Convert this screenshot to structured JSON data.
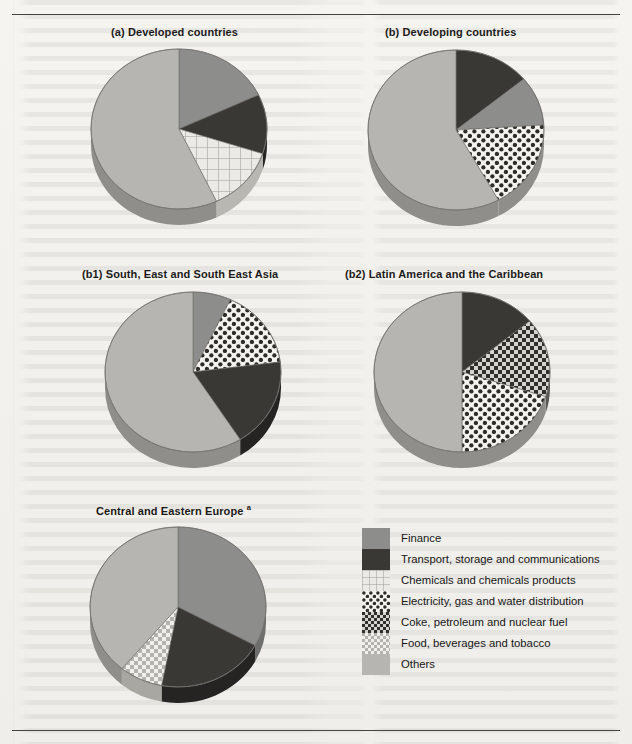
{
  "page": {
    "background_color": "#f3f2ef",
    "rule_color": "#45433f"
  },
  "chart_data": {
    "type": "pie",
    "title": "",
    "legend_position": "bottom-right",
    "categories": [
      "Finance",
      "Transport, storage and communications",
      "Chemicals and chemicals products",
      "Electricity, gas and water distribution",
      "Coke, petroleum and nuclear fuel",
      "Food, beverages and tobacco",
      "Others"
    ],
    "category_colors": [
      "#8d8d8b",
      "#393835",
      "#e7e6e2",
      "#f0efeb",
      "#6f6e6a",
      "#d9d8d3",
      "#b6b5b1"
    ],
    "panels": [
      {
        "id": "a",
        "title": "(a) Developed countries",
        "title_prefix": "(a)",
        "title_text": "Developed countries",
        "slices": [
          {
            "category": "Finance",
            "value": 18
          },
          {
            "category": "Transport, storage and communications",
            "value": 12
          },
          {
            "category": "Chemicals and chemicals products",
            "value": 13
          },
          {
            "category": "Others",
            "value": 57
          }
        ]
      },
      {
        "id": "b",
        "title": "(b) Developing countries",
        "title_prefix": "(b)",
        "title_text": "Developing countries",
        "slices": [
          {
            "category": "Transport, storage and communications",
            "value": 14
          },
          {
            "category": "Finance",
            "value": 10
          },
          {
            "category": "Electricity, gas and water distribution",
            "value": 18
          },
          {
            "category": "Others",
            "value": 58
          }
        ]
      },
      {
        "id": "b1",
        "title": "(b1) South, East and South East Asia",
        "title_prefix": "(b1)",
        "title_text": "South, East and South East Asia",
        "slices": [
          {
            "category": "Finance",
            "value": 7
          },
          {
            "category": "Electricity, gas and water distribution",
            "value": 16
          },
          {
            "category": "Transport, storage and communications",
            "value": 18
          },
          {
            "category": "Others",
            "value": 59
          }
        ]
      },
      {
        "id": "b2",
        "title": "(b2) Latin America and the Caribbean",
        "title_prefix": "(b2)",
        "title_text": "Latin America and the Caribbean",
        "slices": [
          {
            "category": "Transport, storage and communications",
            "value": 14
          },
          {
            "category": "Coke, petroleum and nuclear fuel",
            "value": 16
          },
          {
            "category": "Electricity, gas and water distribution",
            "value": 20
          },
          {
            "category": "Others",
            "value": 50
          }
        ]
      },
      {
        "id": "c",
        "title": "(c) Central and Eastern Europe a",
        "title_prefix": "(c)",
        "title_text": "Central and Eastern Europe",
        "title_superscript": "a",
        "slices": [
          {
            "category": "Finance",
            "value": 33
          },
          {
            "category": "Transport, storage and communications",
            "value": 20
          },
          {
            "category": "Food, beverages and tobacco",
            "value": 8
          },
          {
            "category": "Others",
            "value": 39
          }
        ]
      }
    ]
  },
  "legend": {
    "items": [
      {
        "label": "Finance",
        "pattern": "solid-gray"
      },
      {
        "label": "Transport, storage and communications",
        "pattern": "solid-dark"
      },
      {
        "label": "Chemicals and chemicals products",
        "pattern": "grid-light"
      },
      {
        "label": "Electricity, gas and water distribution",
        "pattern": "polka-dots"
      },
      {
        "label": "Coke, petroleum and nuclear fuel",
        "pattern": "checkerboard-dark"
      },
      {
        "label": "Food, beverages and tobacco",
        "pattern": "checkerboard-light"
      },
      {
        "label": "Others",
        "pattern": "solid-light-gray"
      }
    ]
  }
}
